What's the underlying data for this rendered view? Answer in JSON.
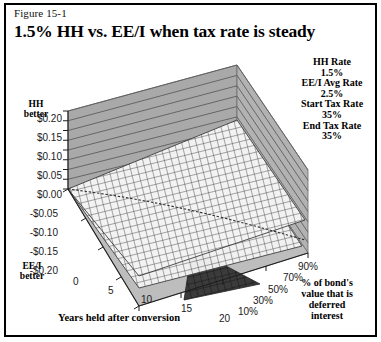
{
  "figure": {
    "label": "Figure 15-1",
    "title": "1.5% HH vs. EE/I when tax rate is steady"
  },
  "parameters": [
    {
      "name": "HH Rate",
      "value": "1.5%"
    },
    {
      "name": "EE/I Avg Rate",
      "value": "2.5%"
    },
    {
      "name": "Start Tax Rate",
      "value": "35%"
    },
    {
      "name": "End Tax Rate",
      "value": "35%"
    }
  ],
  "annotations": {
    "y_top_note_line1": "HH",
    "y_top_note_line2": "better",
    "y_bottom_note_line1": "EE/I",
    "y_bottom_note_line2": "better"
  },
  "z_axis_title_lines": [
    "% of bond's",
    "value that is",
    "deferred",
    "interest"
  ],
  "colors": {
    "wall": "#a9a9a9",
    "wall_line": "#5a5a5a",
    "floor": "#bdbdbd",
    "surface_light": "#f2f2f2",
    "surface_mesh": "#4a4a4a",
    "surface_dark": "#3a3a3a",
    "border": "#000000",
    "text": "#000000"
  },
  "chart_data": {
    "type": "surface",
    "title": "1.5% HH vs. EE/I when tax rate is steady",
    "subtitle": "Figure 15-1",
    "xlabel": "Years held after conversion",
    "ylabel": "Dollar advantage (HH better positive, EE/I better negative)",
    "zlabel": "% of bond's value that is deferred interest",
    "xlim": [
      0,
      20
    ],
    "ylim": [
      -0.2,
      0.2
    ],
    "grid": true,
    "legend_position": "top-right",
    "x": [
      0,
      5,
      10,
      15,
      20
    ],
    "xticks": [
      "0",
      "5",
      "10",
      "15",
      "20"
    ],
    "yticks": [
      "$0.20",
      "$0.15",
      "$0.10",
      "$0.05",
      "$0.00",
      "-$0.05",
      "-$0.10",
      "-$0.15",
      "-$0.20"
    ],
    "ytick_values": [
      0.2,
      0.15,
      0.1,
      0.05,
      0.0,
      -0.05,
      -0.1,
      -0.15,
      -0.2
    ],
    "z": [
      10,
      30,
      50,
      70,
      90
    ],
    "zticks": [
      "10%",
      "30%",
      "50%",
      "70%",
      "90%"
    ],
    "series": [
      {
        "name": "10%",
        "values": [
          0.0,
          -0.01,
          -0.02,
          -0.03,
          -0.04
        ]
      },
      {
        "name": "30%",
        "values": [
          0.0,
          -0.02,
          -0.04,
          -0.06,
          -0.08
        ]
      },
      {
        "name": "50%",
        "values": [
          0.0,
          -0.03,
          -0.06,
          -0.09,
          -0.12
        ]
      },
      {
        "name": "70%",
        "values": [
          0.0,
          -0.04,
          -0.08,
          -0.12,
          -0.16
        ]
      },
      {
        "name": "90%",
        "values": [
          0.0,
          -0.05,
          -0.1,
          -0.15,
          -0.2
        ]
      }
    ],
    "note": "Surface descends from $0.00 at year 0 to negative values, steepening with higher deferred-interest percentage; EE/I becomes better over time."
  },
  "ticks": {
    "y": [
      {
        "text": "$0.20",
        "left": 18,
        "top": 113
      },
      {
        "text": "$0.15",
        "left": 18,
        "top": 132
      },
      {
        "text": "$0.10",
        "left": 18,
        "top": 151
      },
      {
        "text": "$0.05",
        "left": 18,
        "top": 170
      },
      {
        "text": "$0.00",
        "left": 18,
        "top": 189
      },
      {
        "text": "-$0.05",
        "left": 14,
        "top": 208
      },
      {
        "text": "-$0.10",
        "left": 14,
        "top": 227
      },
      {
        "text": "-$0.15",
        "left": 14,
        "top": 246
      },
      {
        "text": "-$0.20",
        "left": 14,
        "top": 265
      }
    ],
    "x": [
      {
        "text": "0",
        "left": 73,
        "top": 276
      },
      {
        "text": "5",
        "left": 108,
        "top": 285
      },
      {
        "text": "10",
        "left": 141,
        "top": 294
      },
      {
        "text": "15",
        "left": 181,
        "top": 303
      },
      {
        "text": "20",
        "left": 219,
        "top": 313
      }
    ],
    "z": [
      {
        "text": "10%",
        "left": 238,
        "top": 306
      },
      {
        "text": "30%",
        "left": 253,
        "top": 295
      },
      {
        "text": "50%",
        "left": 268,
        "top": 284
      },
      {
        "text": "70%",
        "left": 283,
        "top": 272
      },
      {
        "text": "90%",
        "left": 298,
        "top": 261
      }
    ]
  }
}
